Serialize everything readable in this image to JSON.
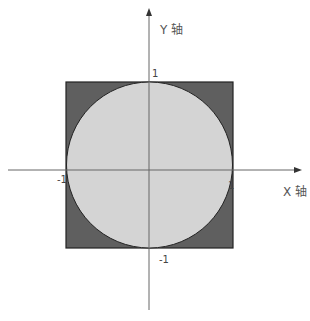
{
  "diagram": {
    "type": "unit circle inscribed in square",
    "axes": {
      "x_label": "X 轴",
      "y_label": "Y 轴"
    },
    "ticks": {
      "x_pos": "1",
      "x_neg": "-1",
      "y_pos": "1",
      "y_neg": "-1"
    },
    "colors": {
      "square_fill": "#5f5f5f",
      "circle_fill": "#d4d4d4",
      "axis": "#555555",
      "border": "#222222"
    }
  }
}
